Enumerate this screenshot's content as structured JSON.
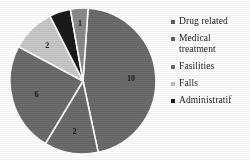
{
  "chart_data": {
    "type": "pie",
    "title": "",
    "subtitle": "",
    "xlabel": "",
    "ylabel": "",
    "grid": false,
    "legend_position": "right",
    "total": 22,
    "categories": [
      "Drug related",
      "Medical treatment",
      "Fasilities",
      "Falls",
      "Administratif",
      "Other"
    ],
    "values": [
      10,
      2,
      6,
      2,
      1,
      1
    ],
    "labels": [
      "10",
      "2",
      "6",
      "2",
      "1",
      "1"
    ],
    "colors": [
      "#6b6b6b",
      "#6b6b6b",
      "#6b6b6b",
      "#c8c8c8",
      "#1a1a1a",
      "#8a8a8a"
    ],
    "slices": [
      {
        "name": "Drug related",
        "value": 10,
        "label": "10",
        "color": "#6b6b6b",
        "start_deg": 4,
        "end_deg": 168
      },
      {
        "name": "Medical treatment",
        "value": 2,
        "label": "2",
        "color": "#6b6b6b",
        "start_deg": 168,
        "end_deg": 211
      },
      {
        "name": "Fasilities",
        "value": 6,
        "label": "6",
        "color": "#6b6b6b",
        "start_deg": 211,
        "end_deg": 298
      },
      {
        "name": "Falls",
        "value": 2,
        "label": "2",
        "color": "#c8c8c8",
        "start_deg": 298,
        "end_deg": 333
      },
      {
        "name": "Administratif",
        "value": 1,
        "label": "1",
        "color": "#1a1a1a",
        "start_deg": 333,
        "end_deg": 350
      },
      {
        "name": "Other",
        "value": 1,
        "label": "1",
        "color": "#8a8a8a",
        "start_deg": 350,
        "end_deg": 364
      }
    ]
  },
  "legend": {
    "items": [
      {
        "label": "Drug related",
        "color": "#5e5e5e"
      },
      {
        "label": "Medical\ntreatment",
        "color": "#5e5e5e"
      },
      {
        "label": "Fasilities",
        "color": "#6b6b6b"
      },
      {
        "label": "Falls",
        "color": "#c2c2c2"
      },
      {
        "label": "Administratif",
        "color": "#1a1a1a"
      }
    ]
  }
}
